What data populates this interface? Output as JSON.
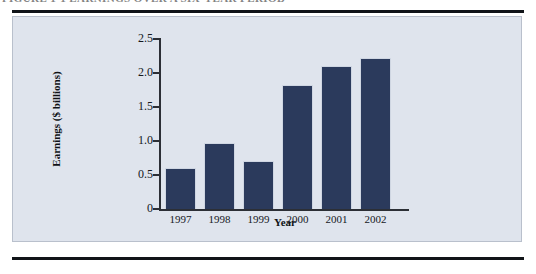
{
  "figure": {
    "caption": "FIGURE 1-1   EARNINGS OVER A SIX-YEAR PERIOD",
    "panel_background": "#dfe4ed",
    "rule_color": "#111418"
  },
  "chart_data": {
    "type": "bar",
    "title": "",
    "categories": [
      "1997",
      "1998",
      "1999",
      "2000",
      "2001",
      "2002"
    ],
    "values": [
      0.6,
      0.97,
      0.7,
      1.82,
      2.1,
      2.22
    ],
    "xlabel": "Year",
    "ylabel": "Earnings ($ billions)",
    "ylim": [
      0,
      2.5
    ],
    "yticks": [
      "0",
      "0.5",
      "1.0",
      "1.5",
      "2.0",
      "2.5"
    ],
    "ytick_values": [
      0,
      0.5,
      1.0,
      1.5,
      2.0,
      2.5
    ],
    "grid": false,
    "legend": "none",
    "bar_color": "#2b3a5c",
    "axis_color": "#2c2f36"
  }
}
